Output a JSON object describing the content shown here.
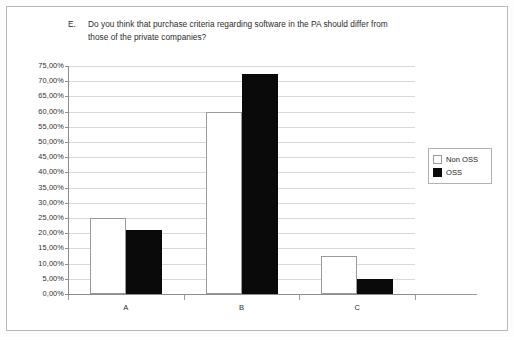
{
  "chart_data": {
    "type": "bar",
    "title": "Do you think that purchase criteria regarding software in the PA should differ from those of the private companies?",
    "title_label": "E.",
    "title_line1": "Do you think that purchase criteria regarding software in the PA should",
    "title_line2": "differ from those of the private companies?",
    "xlabel": "",
    "ylabel": "",
    "categories": [
      "A",
      "B",
      "C"
    ],
    "series": [
      {
        "name": "Non OSS",
        "values": [
          25.0,
          60.0,
          12.5
        ],
        "color": "#ffffff"
      },
      {
        "name": "OSS",
        "values": [
          21.0,
          72.5,
          5.0
        ],
        "color": "#0a0a0a"
      }
    ],
    "ylim": [
      0,
      75
    ],
    "ytick_step": 5,
    "ytick_labels": [
      "75,00%",
      "70,00%",
      "65,00%",
      "60,00%",
      "55,00%",
      "50,00%",
      "45,00%",
      "40,00%",
      "35,00%",
      "30,00%",
      "25,00%",
      "20,00%",
      "15,00%",
      "10,00%",
      "5,00%",
      "0,00%"
    ],
    "ytick_values": [
      75,
      70,
      65,
      60,
      55,
      50,
      45,
      40,
      35,
      30,
      25,
      20,
      15,
      10,
      5,
      0
    ],
    "grid": true,
    "legend_position": "right"
  },
  "legend": {
    "entries": [
      {
        "label": "Non OSS"
      },
      {
        "label": "OSS"
      }
    ]
  }
}
